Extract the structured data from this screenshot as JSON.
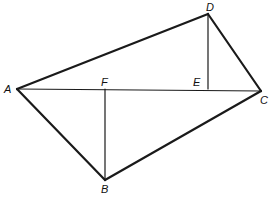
{
  "diagram": {
    "type": "geometry",
    "points": {
      "A": {
        "label": "A",
        "x": 17,
        "y": 89
      },
      "B": {
        "label": "B",
        "x": 105,
        "y": 180
      },
      "C": {
        "label": "C",
        "x": 261,
        "y": 91
      },
      "D": {
        "label": "D",
        "x": 208,
        "y": 14
      },
      "E": {
        "label": "E",
        "x": 208,
        "y": 89
      },
      "F": {
        "label": "F",
        "x": 105,
        "y": 89
      }
    },
    "segments": [
      {
        "name": "AD",
        "from": "A",
        "to": "D",
        "weight": "thick"
      },
      {
        "name": "DC",
        "from": "D",
        "to": "C",
        "weight": "thick"
      },
      {
        "name": "CB",
        "from": "C",
        "to": "B",
        "weight": "thick"
      },
      {
        "name": "BA",
        "from": "B",
        "to": "A",
        "weight": "thick"
      },
      {
        "name": "AC",
        "from": "A",
        "to": "C",
        "weight": "thin"
      },
      {
        "name": "DE",
        "from": "D",
        "to": "E",
        "weight": "thin"
      },
      {
        "name": "BF",
        "from": "B",
        "to": "F",
        "weight": "thin"
      }
    ],
    "stroke_color": "#1a1a1a"
  }
}
